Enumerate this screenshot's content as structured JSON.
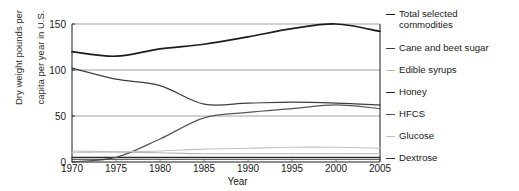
{
  "chart_data": {
    "type": "line",
    "title": "",
    "xlabel": "Year",
    "ylabel": "Dry weight pounds per capita per year in U.S.",
    "ylabel_line1": "Dry weight pounds per",
    "ylabel_line2": "capita per year in U.S.",
    "xlim": [
      1970,
      2005
    ],
    "ylim": [
      0,
      150
    ],
    "yticks": [
      0,
      50,
      100,
      150
    ],
    "xticks": [
      1970,
      1975,
      1980,
      1985,
      1990,
      1995,
      2000,
      2005
    ],
    "grid": "horizontal",
    "legend_position": "right",
    "x": [
      1970,
      1975,
      1980,
      1985,
      1990,
      1995,
      2000,
      2005
    ],
    "series": [
      {
        "name": "Total selected commodities",
        "legend_label_line1": "Total selected",
        "legend_label_line2": "commodities",
        "color": "#1c1c1c",
        "width": 1.7,
        "values": [
          120,
          115,
          123,
          128,
          136,
          145,
          150,
          142
        ]
      },
      {
        "name": "Cane and beet sugar",
        "legend_label_line1": "Cane and beet sugar",
        "legend_label_line2": "",
        "color": "#3d3d3d",
        "width": 1.2,
        "values": [
          102,
          90,
          83,
          63,
          64,
          65,
          64,
          62
        ]
      },
      {
        "name": "Edible syrups",
        "legend_label_line1": "Edible syrups",
        "legend_label_line2": "",
        "color": "#b8b8b8",
        "width": 1.1,
        "values": [
          12,
          11,
          10,
          9,
          9,
          9,
          9,
          9
        ]
      },
      {
        "name": "Honey",
        "legend_label_line1": "Honey",
        "legend_label_line2": "",
        "color": "#2a2a2a",
        "width": 1.2,
        "values": [
          5,
          5,
          5,
          5,
          5,
          5,
          5,
          5
        ]
      },
      {
        "name": "HFCS",
        "legend_label_line1": "HFCS",
        "legend_label_line2": "",
        "color": "#555555",
        "width": 1.2,
        "values": [
          0,
          5,
          25,
          48,
          54,
          58,
          62,
          58
        ]
      },
      {
        "name": "Glucose",
        "legend_label_line1": "Glucose",
        "legend_label_line2": "",
        "color": "#c2c2c2",
        "width": 1.1,
        "values": [
          10,
          11,
          12,
          14,
          15,
          16,
          16,
          15
        ]
      },
      {
        "name": "Dextrose",
        "legend_label_line1": "Dextrose",
        "legend_label_line2": "",
        "color": "#333333",
        "width": 1.1,
        "values": [
          3,
          3,
          3,
          3,
          3,
          3,
          3,
          3
        ]
      }
    ]
  }
}
